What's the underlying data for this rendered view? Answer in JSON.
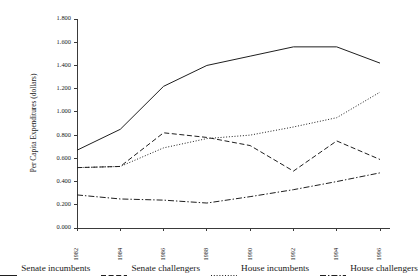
{
  "chart_data": {
    "type": "line",
    "title": "",
    "xlabel": "",
    "ylabel": "Per Capita Expenditures (dollars)",
    "categories": [
      "1982",
      "1984",
      "1986",
      "1988",
      "1990",
      "1992",
      "1994",
      "1996"
    ],
    "x": [
      1982,
      1984,
      1986,
      1988,
      1990,
      1992,
      1994,
      1996
    ],
    "ylim": [
      0.0,
      1.8
    ],
    "yticks": [
      "0.000",
      "0.200",
      "0.400",
      "0.600",
      "0.800",
      "1.000",
      "1.200",
      "1.400",
      "1.600",
      "1.800"
    ],
    "ytick_values": [
      0.0,
      0.2,
      0.4,
      0.6,
      0.8,
      1.0,
      1.2,
      1.4,
      1.6,
      1.8
    ],
    "grid": false,
    "legend_position": "bottom",
    "series": [
      {
        "name": "Senate incumbents",
        "style": "solid",
        "values": [
          0.67,
          0.85,
          1.22,
          1.4,
          1.48,
          1.56,
          1.56,
          1.42
        ]
      },
      {
        "name": "Senate challengers",
        "style": "dashed",
        "values": [
          0.52,
          0.53,
          0.82,
          0.78,
          0.71,
          0.49,
          0.75,
          0.59
        ]
      },
      {
        "name": "House incumbents",
        "style": "dotted",
        "values": [
          0.52,
          0.53,
          0.69,
          0.77,
          0.8,
          0.87,
          0.95,
          1.17
        ]
      },
      {
        "name": "House challengers",
        "style": "dashdot",
        "values": [
          0.285,
          0.25,
          0.24,
          0.215,
          0.27,
          0.33,
          0.4,
          0.475
        ]
      }
    ]
  },
  "legend": {
    "items": [
      {
        "label": "Senate incumbents",
        "style": "solid"
      },
      {
        "label": "Senate challengers",
        "style": "dashed"
      },
      {
        "label": "House incumbents",
        "style": "dotted"
      },
      {
        "label": "House challengers",
        "style": "dashdot"
      }
    ]
  },
  "colors": {
    "line": "#1f1f1f",
    "axis": "#3a3a3a",
    "text": "#1a1a1a",
    "background": "#ffffff"
  }
}
